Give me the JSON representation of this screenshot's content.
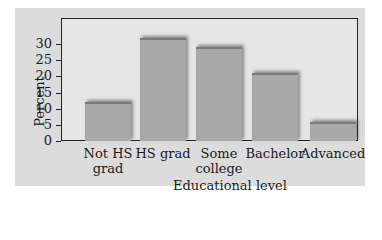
{
  "chart_data": {
    "type": "bar",
    "title": "",
    "xlabel": "Educational level",
    "ylabel": "Percent",
    "categories": [
      "Not HS grad",
      "HS grad",
      "Some college",
      "Bachelor",
      "Advanced"
    ],
    "category_lines": [
      [
        "Not HS",
        "grad"
      ],
      [
        "HS grad"
      ],
      [
        "Some",
        "college"
      ],
      [
        "Bachelor"
      ],
      [
        "Advanced"
      ]
    ],
    "values": [
      12,
      32,
      29,
      21,
      6
    ],
    "ylim": [
      0,
      35
    ],
    "yticks": [
      0,
      5,
      10,
      15,
      20,
      25,
      30
    ],
    "grid": false,
    "legend": null,
    "colors": {
      "bar": "#a9a9a9",
      "background": "#dcdcdc",
      "plot_area": "#e6e6e6"
    }
  }
}
